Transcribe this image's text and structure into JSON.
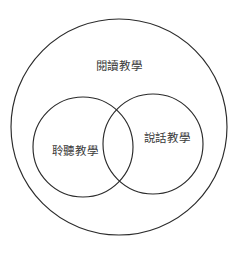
{
  "diagram": {
    "type": "venn",
    "title": "",
    "background_color": "#ffffff",
    "stroke_color": "#2b2b2b",
    "text_color": "#3a3a3a",
    "sets": [
      {
        "id": "outer",
        "label": "閱讀教學",
        "role": "container",
        "cx": 119,
        "cy": 127,
        "r": 108,
        "label_x": 119,
        "label_y": 66
      },
      {
        "id": "left",
        "label": "聆聽教學",
        "role": "subset",
        "cx": 83,
        "cy": 147,
        "r": 50,
        "label_x": 75,
        "label_y": 151
      },
      {
        "id": "right",
        "label": "說話教學",
        "role": "subset",
        "cx": 153,
        "cy": 144,
        "r": 50,
        "label_x": 167,
        "label_y": 138
      }
    ]
  }
}
